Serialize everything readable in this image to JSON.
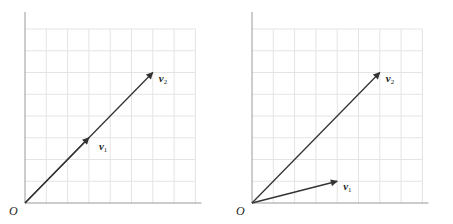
{
  "figure": {
    "grid_color": "#e4e4e4",
    "axis_color": "#9a9a9a",
    "vector_color": "#333333",
    "grid_unit_px": 21.3,
    "panels": [
      {
        "id": "left",
        "origin_label": "O",
        "origin_px": [
          25,
          203
        ],
        "grid_cols": 8,
        "grid_rows": 8,
        "vectors": [
          {
            "name": "v",
            "sub": "1",
            "components": [
              3,
              3
            ],
            "label_offset": [
              10,
              12
            ]
          },
          {
            "name": "v",
            "sub": "2",
            "components": [
              6,
              6
            ],
            "label_offset": [
              6,
              9
            ]
          }
        ]
      },
      {
        "id": "right",
        "origin_label": "O",
        "origin_px": [
          252,
          203
        ],
        "grid_cols": 8,
        "grid_rows": 8,
        "vectors": [
          {
            "name": "v",
            "sub": "1",
            "components": [
              4,
              1
            ],
            "label_offset": [
              6,
              9
            ]
          },
          {
            "name": "v",
            "sub": "2",
            "components": [
              6,
              6
            ],
            "label_offset": [
              6,
              9
            ]
          }
        ]
      }
    ]
  }
}
